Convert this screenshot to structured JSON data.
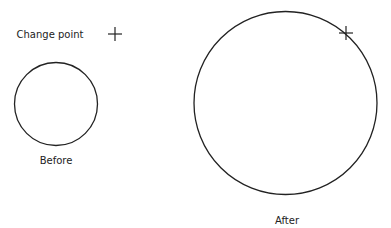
{
  "legend": {
    "label": "Change point",
    "marker": "plus-marker"
  },
  "diagrams": [
    {
      "id": "before",
      "caption": "Before",
      "shape": "circle"
    },
    {
      "id": "after",
      "caption": "After",
      "shape": "circle",
      "change_point_marker": "plus-marker"
    }
  ],
  "colors": {
    "stroke": "#222222",
    "background": "#ffffff"
  }
}
